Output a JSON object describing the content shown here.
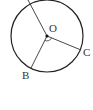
{
  "diagram": {
    "type": "circle-with-radii",
    "center": {
      "label": "O",
      "x": 47,
      "y": 36
    },
    "radius": 36,
    "points": [
      {
        "label": "A",
        "x": 28,
        "y": 1,
        "label_visible": false
      },
      {
        "label": "B",
        "x": 31,
        "y": 68
      },
      {
        "label": "C",
        "x": 81,
        "y": 50
      }
    ],
    "angle_mark": {
      "between": [
        "OB",
        "OC"
      ]
    },
    "colors": {
      "stroke": "#222222",
      "label": "#333333"
    }
  },
  "labels": {
    "O": "O",
    "B": "B",
    "C": "C"
  }
}
